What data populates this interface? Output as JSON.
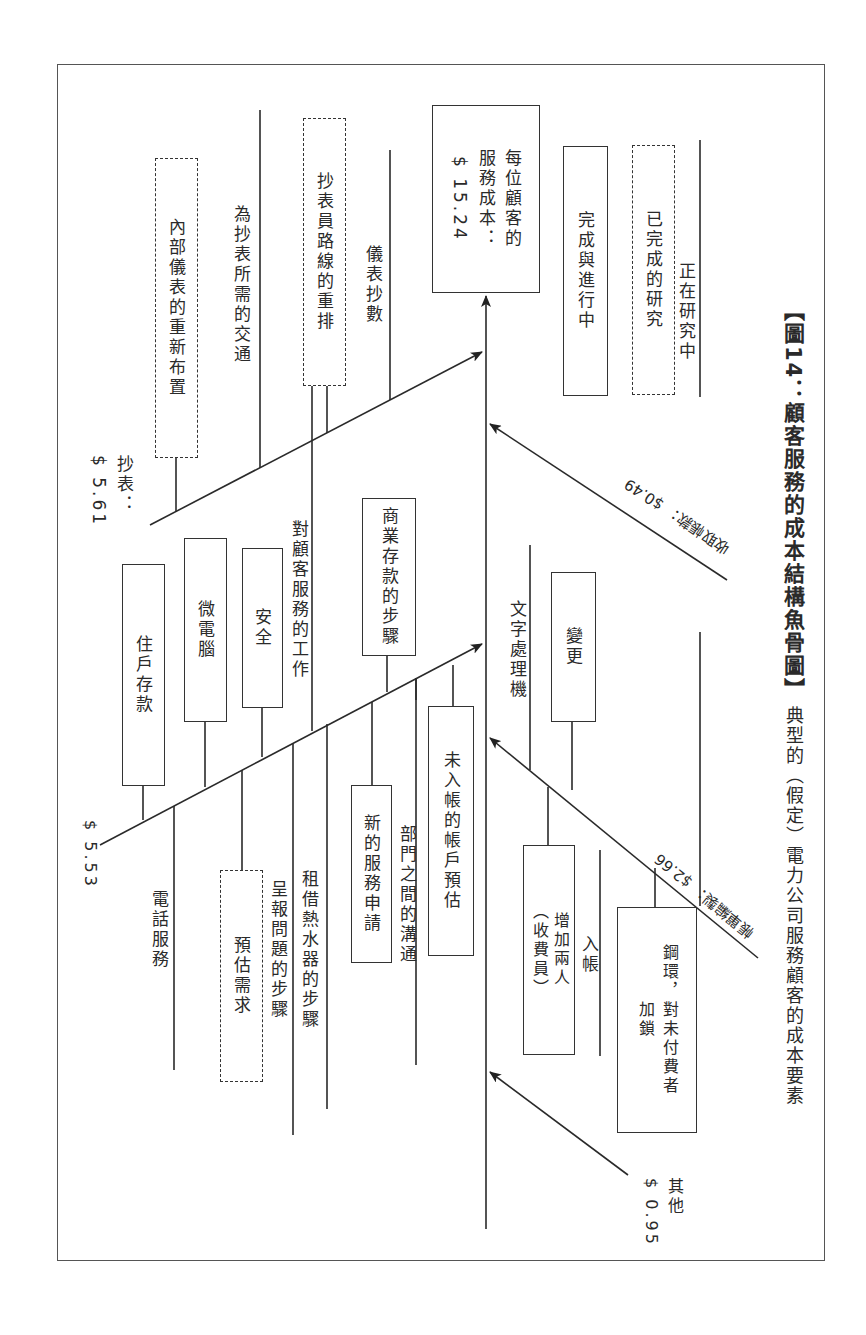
{
  "caption": {
    "title": "【圖14：顧客服務的成本結構魚骨圖】",
    "subtitle": "典型的（假定）電力公司服務顧客的成本要素"
  },
  "head": {
    "line1": "每位顧客的",
    "line2": "服務成本：",
    "line3": "$ 15.24"
  },
  "legend": {
    "solid_box": "完成與進行中",
    "dashed_box": "已完成的研究",
    "line": "正在研究中"
  },
  "branches": {
    "meter_reading": {
      "label": "抄表：",
      "cost": "$ 5.61",
      "items": [
        {
          "text": "內部儀表的重新布置",
          "status": "completed-research"
        },
        {
          "text": "為抄表所需的交通",
          "status": "under-study"
        },
        {
          "text": "抄表員路線的重排",
          "status": "completed-research"
        },
        {
          "text": "儀表抄數",
          "status": "under-study"
        }
      ]
    },
    "customer_service": {
      "cost": "$ 5.53",
      "items_upper": [
        {
          "text": "住戶存款",
          "status": "done-in-progress"
        },
        {
          "text": "微電腦",
          "status": "done-in-progress"
        },
        {
          "text": "安全",
          "status": "done-in-progress"
        },
        {
          "text": "對顧客服務的工作",
          "status": "under-study"
        },
        {
          "text": "商業存款的步驟",
          "status": "done-in-progress"
        }
      ],
      "items_lower": [
        {
          "text": "電話服務",
          "status": "under-study"
        },
        {
          "text": "預估需求",
          "status": "completed-research"
        },
        {
          "text": "呈報問題的步驟",
          "status": "under-study"
        },
        {
          "text": "租借熱水器的步驟",
          "status": "under-study"
        },
        {
          "text": "新的服務申請",
          "status": "done-in-progress"
        },
        {
          "text": "部門之間的溝通",
          "status": "under-study"
        },
        {
          "text": "未入帳的帳戶預估",
          "status": "done-in-progress"
        }
      ]
    },
    "billing": {
      "label": "帳單編製：",
      "cost": "$2.66",
      "items": [
        {
          "text": "文字處理機",
          "status": "under-study"
        },
        {
          "text": "變更",
          "status": "done-in-progress"
        },
        {
          "text": "增加兩人（收費員）",
          "status": "done-in-progress"
        },
        {
          "text": "入帳",
          "status": "under-study"
        },
        {
          "text": "鋼環，對未付費者加鎖",
          "status": "done-in-progress"
        },
        {
          "text": "",
          "status": "under-study"
        }
      ],
      "box_add_staff": {
        "l1": "增加兩人",
        "l2": "（收費員）"
      },
      "box_lock": {
        "l1": "鋼環，對未付費者",
        "l2": "加鎖"
      },
      "sub_label": "催收"
    },
    "collections": {
      "label": "收取帳款：",
      "cost": "$0.49"
    },
    "other": {
      "label": "其他",
      "cost": "$ 0.95"
    }
  }
}
